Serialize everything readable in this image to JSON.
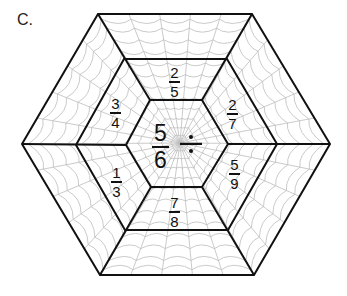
{
  "problem_label": "C.",
  "center": {
    "fraction": {
      "numerator": "5",
      "denominator": "6"
    },
    "operation": "÷",
    "operation_name": "division"
  },
  "cells": [
    {
      "position": "top",
      "numerator": "2",
      "denominator": "5"
    },
    {
      "position": "upper-right",
      "numerator": "2",
      "denominator": "7"
    },
    {
      "position": "lower-right",
      "numerator": "5",
      "denominator": "9"
    },
    {
      "position": "bottom",
      "numerator": "7",
      "denominator": "8"
    },
    {
      "position": "lower-left",
      "numerator": "1",
      "denominator": "3"
    },
    {
      "position": "upper-left",
      "numerator": "3",
      "denominator": "4"
    }
  ],
  "colors": {
    "outline": "#111111",
    "web": "#b8b8b8",
    "text": "#111111"
  }
}
